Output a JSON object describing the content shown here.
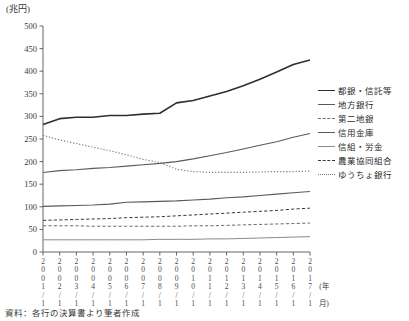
{
  "unit_label": "(兆円)",
  "source_note": "資料：各行の決算書より筆者作成",
  "axis": {
    "x_caption_year": "年",
    "x_caption_month": "月",
    "x_caption_slash": "/",
    "x_caption_paren_open": "(",
    "x_caption_paren_close": ")"
  },
  "legend": {
    "items": [
      {
        "label": "都銀・信託等",
        "style": "solid",
        "color": "#2f2f2f",
        "width": 1.6
      },
      {
        "label": "地方銀行",
        "style": "solid",
        "color": "#5a5a5a",
        "width": 1.1
      },
      {
        "label": "第二地銀",
        "style": "dashed",
        "color": "#6a6a6a",
        "width": 1.0
      },
      {
        "label": "信用金庫",
        "style": "solid",
        "color": "#5a5a5a",
        "width": 1.1
      },
      {
        "label": "信組・労金",
        "style": "solid",
        "color": "#8a8a8a",
        "width": 1.0
      },
      {
        "label": "農業協同組合",
        "style": "dashed",
        "color": "#3a3a3a",
        "width": 1.0
      },
      {
        "label": "ゆうちょ銀行",
        "style": "dotted",
        "color": "#7a7a7a",
        "width": 1.2
      }
    ]
  },
  "chart_data": {
    "type": "line",
    "title": "",
    "xlabel": "(年/月)",
    "ylabel": "(兆円)",
    "ylim": [
      0,
      500
    ],
    "ytick_step": 50,
    "yticks": [
      0,
      50,
      100,
      150,
      200,
      250,
      300,
      350,
      400,
      450,
      500
    ],
    "grid": false,
    "legend_position": "right",
    "x": [
      "2001/1",
      "2002/1",
      "2003/1",
      "2004/1",
      "2005/1",
      "2006/1",
      "2007/1",
      "2008/1",
      "2009/1",
      "2010/1",
      "2011/1",
      "2012/1",
      "2013/1",
      "2014/1",
      "2015/1",
      "2016/1",
      "2017/1"
    ],
    "x_labels_vertical": [
      [
        "2",
        "0",
        "0",
        "1",
        "/",
        "1"
      ],
      [
        "2",
        "0",
        "0",
        "2",
        "/",
        "1"
      ],
      [
        "2",
        "0",
        "0",
        "3",
        "/",
        "1"
      ],
      [
        "2",
        "0",
        "0",
        "4",
        "/",
        "1"
      ],
      [
        "2",
        "0",
        "0",
        "5",
        "/",
        "1"
      ],
      [
        "2",
        "0",
        "0",
        "6",
        "/",
        "1"
      ],
      [
        "2",
        "0",
        "0",
        "7",
        "/",
        "1"
      ],
      [
        "2",
        "0",
        "0",
        "8",
        "/",
        "1"
      ],
      [
        "2",
        "0",
        "0",
        "9",
        "/",
        "1"
      ],
      [
        "2",
        "0",
        "1",
        "0",
        "/",
        "1"
      ],
      [
        "2",
        "0",
        "1",
        "1",
        "/",
        "1"
      ],
      [
        "2",
        "0",
        "1",
        "2",
        "/",
        "1"
      ],
      [
        "2",
        "0",
        "1",
        "3",
        "/",
        "1"
      ],
      [
        "2",
        "0",
        "1",
        "4",
        "/",
        "1"
      ],
      [
        "2",
        "0",
        "1",
        "5",
        "/",
        "1"
      ],
      [
        "2",
        "0",
        "1",
        "6",
        "/",
        "1"
      ],
      [
        "2",
        "0",
        "1",
        "7",
        "/",
        "1"
      ]
    ],
    "series": [
      {
        "name": "都銀・信託等",
        "style": "solid",
        "color": "#2f2f2f",
        "width": 1.6,
        "values": [
          282,
          295,
          298,
          298,
          302,
          302,
          305,
          307,
          330,
          335,
          345,
          355,
          368,
          382,
          398,
          415,
          425
        ]
      },
      {
        "name": "地方銀行",
        "style": "solid",
        "color": "#5a5a5a",
        "width": 1.1,
        "values": [
          176,
          180,
          182,
          185,
          187,
          190,
          193,
          196,
          200,
          206,
          213,
          220,
          228,
          236,
          244,
          254,
          262
        ]
      },
      {
        "name": "第二地銀",
        "style": "dashed",
        "color": "#6a6a6a",
        "width": 1.0,
        "values": [
          58,
          58,
          58,
          57,
          57,
          57,
          57,
          57,
          57,
          58,
          58,
          59,
          60,
          61,
          62,
          63,
          64
        ]
      },
      {
        "name": "信用金庫",
        "style": "solid",
        "color": "#5a5a5a",
        "width": 1.1,
        "values": [
          101,
          102,
          103,
          104,
          106,
          110,
          111,
          112,
          113,
          115,
          117,
          120,
          122,
          125,
          128,
          131,
          134
        ]
      },
      {
        "name": "信組・労金",
        "style": "solid",
        "color": "#8a8a8a",
        "width": 1.0,
        "values": [
          27,
          27,
          27,
          27,
          27,
          27,
          27,
          28,
          28,
          28,
          29,
          29,
          30,
          31,
          32,
          33,
          34
        ]
      },
      {
        "name": "農業協同組合",
        "style": "dashed",
        "color": "#3a3a3a",
        "width": 1.0,
        "values": [
          70,
          71,
          72,
          73,
          74,
          76,
          77,
          78,
          80,
          82,
          84,
          86,
          88,
          90,
          92,
          95,
          97
        ]
      },
      {
        "name": "ゆうちょ銀行",
        "style": "dotted",
        "color": "#7a7a7a",
        "width": 1.2,
        "values": [
          258,
          248,
          240,
          232,
          224,
          215,
          205,
          198,
          183,
          178,
          176,
          176,
          176,
          177,
          178,
          178,
          179
        ]
      }
    ]
  }
}
